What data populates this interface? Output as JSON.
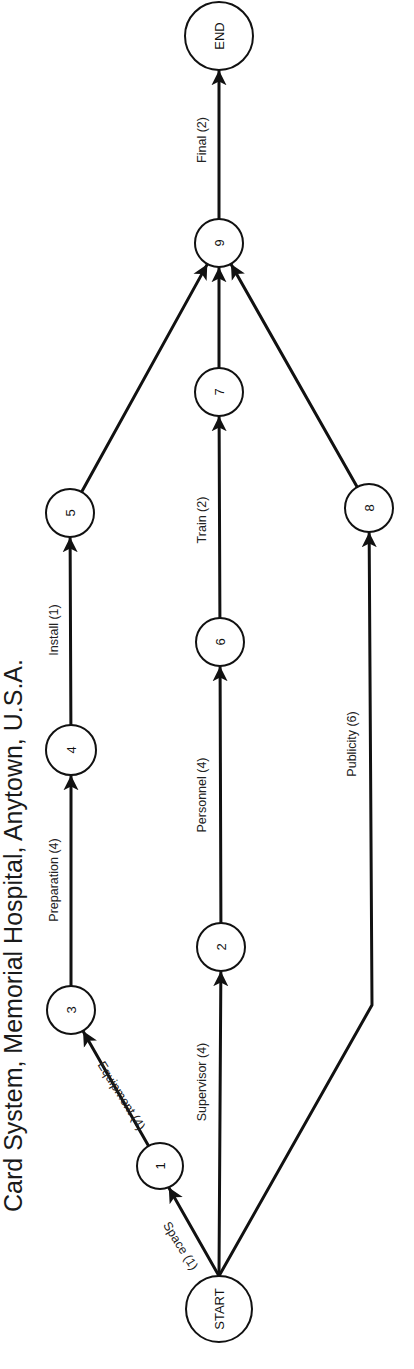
{
  "title": "Card System, Memorial Hospital, Anytown, U.S.A.",
  "colors": {
    "ink": "#111111",
    "background": "#ffffff"
  },
  "nodes": [
    {
      "id": "START",
      "label": "START"
    },
    {
      "id": "1",
      "label": "1"
    },
    {
      "id": "2",
      "label": "2"
    },
    {
      "id": "3",
      "label": "3"
    },
    {
      "id": "4",
      "label": "4"
    },
    {
      "id": "5",
      "label": "5"
    },
    {
      "id": "6",
      "label": "6"
    },
    {
      "id": "7",
      "label": "7"
    },
    {
      "id": "8",
      "label": "8"
    },
    {
      "id": "9",
      "label": "9"
    },
    {
      "id": "END",
      "label": "END"
    }
  ],
  "edges": [
    {
      "from": "START",
      "to": "1",
      "label": "Space (1)",
      "activity": "Space",
      "duration": 1
    },
    {
      "from": "1",
      "to": "3",
      "label": "Equipment (4)",
      "activity": "Equipment",
      "duration": 4
    },
    {
      "from": "3",
      "to": "4",
      "label": "Preparation (4)",
      "activity": "Preparation",
      "duration": 4
    },
    {
      "from": "4",
      "to": "5",
      "label": "Install (1)",
      "activity": "Install",
      "duration": 1
    },
    {
      "from": "5",
      "to": "9",
      "label": "",
      "activity": "",
      "duration": null
    },
    {
      "from": "START",
      "to": "2",
      "label": "Supervisor (4)",
      "activity": "Supervisor",
      "duration": 4
    },
    {
      "from": "2",
      "to": "6",
      "label": "Personnel (4)",
      "activity": "Personnel",
      "duration": 4
    },
    {
      "from": "6",
      "to": "7",
      "label": "Train (2)",
      "activity": "Train",
      "duration": 2
    },
    {
      "from": "7",
      "to": "9",
      "label": "",
      "activity": "",
      "duration": null
    },
    {
      "from": "START",
      "to": "8",
      "label": "Publicity (6)",
      "activity": "Publicity",
      "duration": 6
    },
    {
      "from": "8",
      "to": "9",
      "label": "",
      "activity": "",
      "duration": null
    },
    {
      "from": "9",
      "to": "END",
      "label": "Final (2)",
      "activity": "Final",
      "duration": 2
    }
  ]
}
